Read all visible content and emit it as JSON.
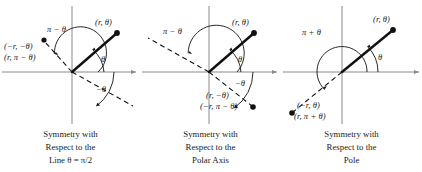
{
  "figure": {
    "colors": {
      "axis": "#8a8a8a",
      "ray": "#111111",
      "dashed": "#111111",
      "text": "#1a1a1a",
      "background": "#ffffff"
    },
    "panels": [
      {
        "id": "panel-1",
        "caption_lines": [
          "Symmetry with",
          "Respect to the",
          "Line θ = π/2"
        ],
        "point_label": "(r, θ)",
        "reflected_labels": [
          "(−r, −θ)",
          "(r, π − θ)"
        ],
        "angle_labels": [
          "π − θ",
          "θ",
          "−θ"
        ]
      },
      {
        "id": "panel-2",
        "caption_lines": [
          "Symmetry with",
          "Respect to the",
          "Polar Axis"
        ],
        "point_label": "(r, θ)",
        "reflected_labels": [
          "(r, −θ)",
          "(−r, π − θ)"
        ],
        "angle_labels": [
          "π − θ",
          "θ",
          "−θ"
        ]
      },
      {
        "id": "panel-3",
        "caption_lines": [
          "Symmetry with",
          "Respect to the",
          "Pole"
        ],
        "point_label": "(r, θ)",
        "reflected_labels": [
          "(−r, θ)",
          "(r, π + θ)"
        ],
        "angle_labels": [
          "π + θ",
          "θ"
        ]
      }
    ]
  }
}
